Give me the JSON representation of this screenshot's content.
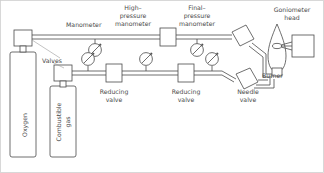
{
  "diagram": {
    "type": "schematic-flow-diagram",
    "labels": {
      "oxygen": "Oxygen",
      "combustible_gas_line1": "Combustible",
      "combustible_gas_line2": "gas",
      "valves": "Valves",
      "manometer": "Manometer",
      "high_pressure_line1": "High–",
      "high_pressure_line2": "pressure",
      "high_pressure_line3": "manometer",
      "final_pressure_line1": "Final–",
      "final_pressure_line2": "pressure",
      "final_pressure_line3": "manometer",
      "goniometer_line1": "Goniometer",
      "goniometer_line2": "head",
      "burner": "Burner",
      "needle_valve_line1": "Needle",
      "needle_valve_line2": "valve",
      "reducing_valve_1_line1": "Reducing",
      "reducing_valve_1_line2": "valve",
      "reducing_valve_2_line1": "Reducing",
      "reducing_valve_2_line2": "valve"
    },
    "components": [
      {
        "name": "oxygen-cylinder",
        "kind": "gas-cylinder",
        "label": "Oxygen"
      },
      {
        "name": "combustible-gas-cylinder",
        "kind": "gas-cylinder",
        "label": "Combustible gas"
      },
      {
        "name": "oxygen-cylinder-valve",
        "kind": "valve-box",
        "label": "Valves"
      },
      {
        "name": "combustible-cylinder-valve",
        "kind": "valve-box",
        "label": "Valves"
      },
      {
        "name": "manometer-gauge-top",
        "kind": "pressure-gauge",
        "label": "Manometer"
      },
      {
        "name": "high-pressure-manometer-gauge",
        "kind": "pressure-gauge",
        "label": "High–pressure manometer"
      },
      {
        "name": "final-pressure-manometer-gauge",
        "kind": "pressure-gauge",
        "label": "Final–pressure manometer"
      },
      {
        "name": "reducing-valve-1",
        "kind": "valve-box",
        "label": "Reducing valve"
      },
      {
        "name": "reducing-valve-2",
        "kind": "valve-box",
        "label": "Reducing valve"
      },
      {
        "name": "needle-valve",
        "kind": "valve-box",
        "label": "Needle valve"
      },
      {
        "name": "burner",
        "kind": "flame-burner",
        "label": "Burner"
      },
      {
        "name": "goniometer-head",
        "kind": "box",
        "label": "Goniometer head"
      }
    ],
    "colors": {
      "line": "#4a4a4a",
      "leader": "#9a9a9a",
      "frame": "#cfcfcf",
      "text": "#4a4a4a",
      "background": "#ffffff"
    }
  }
}
